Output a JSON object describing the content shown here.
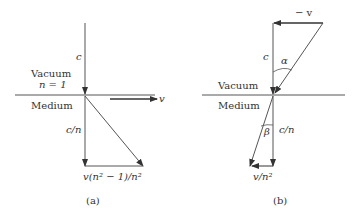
{
  "figure": {
    "panel_a": {
      "caption": "(a)",
      "labels": {
        "c": "c",
        "vacuum": "Vacuum",
        "n_eq": "n = 1",
        "medium": "Medium",
        "v": "v",
        "c_over_n": "c/n",
        "bottom_vector": "v(n² − 1)/n²"
      }
    },
    "panel_b": {
      "caption": "(b)",
      "labels": {
        "minus_v": "− v",
        "c": "c",
        "alpha": "α",
        "vacuum": "Vacuum",
        "medium": "Medium",
        "beta": "β",
        "c_over_n": "c/n",
        "bottom_vector": "v/n²"
      }
    },
    "colors": {
      "line": "#444444",
      "text": "#333333",
      "background": "#ffffff"
    }
  }
}
